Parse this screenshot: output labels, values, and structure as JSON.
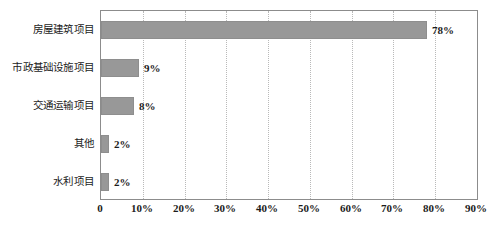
{
  "chart_data": {
    "type": "bar",
    "orientation": "horizontal",
    "title": "",
    "subtitle": "",
    "xlabel": "",
    "ylabel": "",
    "categories": [
      "房屋建筑项目",
      "市政基础设施项目",
      "交通运输项目",
      "其他",
      "水利项目"
    ],
    "values": [
      78,
      9,
      8,
      2,
      2
    ],
    "data_labels": [
      "78%",
      "9%",
      "8%",
      "2%",
      "2%"
    ],
    "xlim": [
      0,
      90
    ],
    "xticks": [
      0,
      10,
      20,
      30,
      40,
      50,
      60,
      70,
      80,
      90
    ],
    "xtick_labels": [
      "0",
      "10%",
      "20%",
      "30%",
      "40%",
      "50%",
      "60%",
      "70%",
      "80%",
      "90%"
    ],
    "grid": "vertical-dotted",
    "legend": "none",
    "bar_color": "#989898",
    "grid_color": "#b9b9b9",
    "axis_color": "#8c8c8c",
    "background_color": "#ffffff",
    "text_color": "#1c1c1c"
  }
}
